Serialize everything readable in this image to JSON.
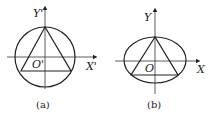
{
  "figures": [
    {
      "caption": "(a)",
      "shape": "circle",
      "axis_x_label": "X'",
      "axis_y_label": "Y'",
      "origin_label": "O'"
    },
    {
      "caption": "(b)",
      "shape": "ellipse",
      "axis_x_label": "X",
      "axis_y_label": "Y",
      "origin_label": "O"
    }
  ],
  "colors": {
    "stroke": "#222222",
    "background": "#ffffff"
  }
}
